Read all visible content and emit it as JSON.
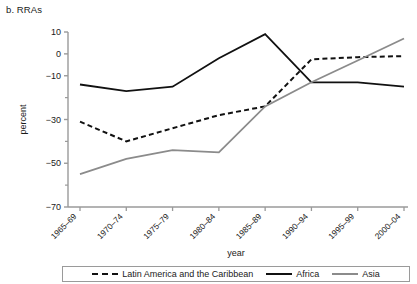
{
  "panel": {
    "title": "b. RRAs"
  },
  "chart_data": {
    "type": "line",
    "title": "b. RRAs",
    "xlabel": "year",
    "ylabel": "percent",
    "categories": [
      "1965–69",
      "1970–74",
      "1975–79",
      "1980–84",
      "1985–89",
      "1990–94",
      "1995–99",
      "2000–04"
    ],
    "ylim": [
      -70,
      10
    ],
    "yticks": [
      10,
      0,
      -10,
      -30,
      -50,
      -70
    ],
    "ytick_labels": [
      "10",
      "0",
      "−10",
      "−30",
      "−50",
      "−70"
    ],
    "yticks_minor": [
      -20,
      -40,
      -60
    ],
    "grid": false,
    "legend_position": "bottom",
    "series": [
      {
        "name": "Latin America and the Caribbean",
        "style": "dashed",
        "color": "#111111",
        "values": [
          -31,
          -40,
          -34,
          -28,
          -24,
          -2.5,
          -1.5,
          -1
        ]
      },
      {
        "name": "Africa",
        "style": "solid",
        "color": "#111111",
        "values": [
          -14,
          -17,
          -15,
          -2,
          9,
          -13,
          -13,
          -15
        ]
      },
      {
        "name": "Asia",
        "style": "solid",
        "color": "#8b8b8b",
        "values": [
          -55,
          -48,
          -44,
          -45,
          -24,
          -13,
          -3,
          7
        ]
      }
    ]
  },
  "legend": {
    "items": [
      {
        "label": "Latin America and the Caribbean",
        "style": "dashed",
        "color": "#111111"
      },
      {
        "label": "Africa",
        "style": "solid",
        "color": "#111111"
      },
      {
        "label": "Asia",
        "style": "solid",
        "color": "#8b8b8b"
      }
    ]
  }
}
